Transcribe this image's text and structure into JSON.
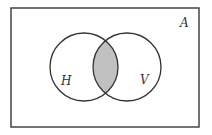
{
  "diagram": {
    "type": "venn",
    "universe": {
      "label": "A",
      "rect": {
        "x": 11,
        "y": 8,
        "width": 188,
        "height": 119
      }
    },
    "sets": [
      {
        "label": "H",
        "cx": 84,
        "cy": 67,
        "r": 34,
        "label_x": 64,
        "label_y": 85
      },
      {
        "label": "V",
        "cx": 127,
        "cy": 67,
        "r": 34,
        "label_x": 141,
        "label_y": 84
      }
    ],
    "shaded_region": "H ∩ V",
    "colors": {
      "stroke": "#333333",
      "shade": "#c0c0c0",
      "background": "#ffffff"
    }
  }
}
